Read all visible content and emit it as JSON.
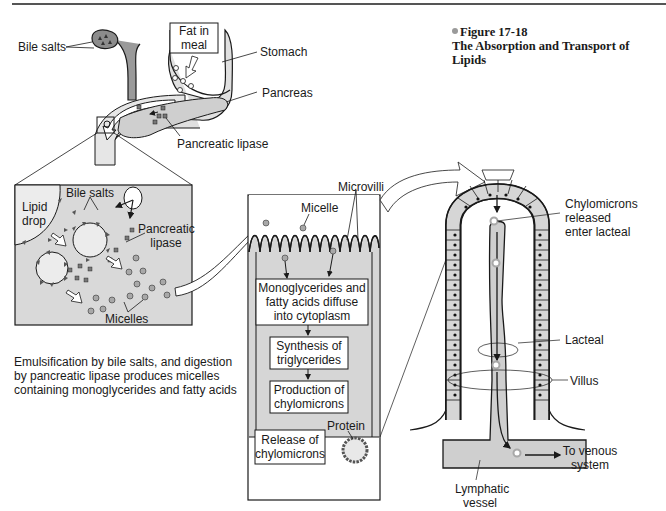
{
  "figure": {
    "number": "Figure 17-18",
    "title": "The Absorption and Transport of Lipids",
    "bullet_color": "#9a9a9a"
  },
  "overview": {
    "labels": {
      "bile_salts": "Bile salts",
      "fat_in_meal": "Fat in meal",
      "stomach": "Stomach",
      "pancreas": "Pancreas",
      "pancreatic_lipase": "Pancreatic lipase"
    }
  },
  "emulsification_panel": {
    "labels": {
      "lipid_drop": "Lipid drop",
      "bile_salts": "Bile salts",
      "pancreatic_lipase": "Pancreatic lipase",
      "micelles": "Micelles"
    },
    "caption": "Emulsification by bile salts, and digestion by pancreatic lipase produces micelles containing monoglycerides and fatty acids"
  },
  "cell_panel": {
    "labels": {
      "microvilli": "Microvilli",
      "micelle": "Micelle",
      "protein": "Protein"
    },
    "steps": [
      "Monoglycerides and fatty acids diffuse into cytoplasm",
      "Synthesis of triglycerides",
      "Production of chylomicrons",
      "Release of chylomicrons"
    ]
  },
  "villus_panel": {
    "labels": {
      "chylomicrons_enter": "Chylomicrons released enter lacteal",
      "lacteal": "Lacteal",
      "villus": "Villus",
      "to_venous": "To venous system",
      "lymphatic_vessel": "Lymphatic vessel"
    }
  },
  "colors": {
    "tissue_fill": "#d6d6d6",
    "panel_fill": "#d9d9d9",
    "stroke": "#1a1a1a",
    "micelle_fill": "#a8a8a8"
  }
}
